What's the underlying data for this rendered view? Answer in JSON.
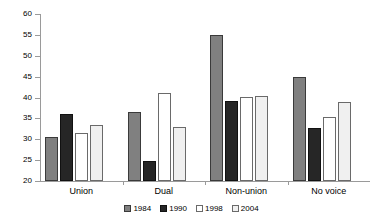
{
  "chart_data": {
    "type": "bar",
    "title": "",
    "subtitle": "",
    "xlabel": "",
    "ylabel": "",
    "categories": [
      "Union",
      "Dual",
      "Non-union",
      "No voice"
    ],
    "series": [
      {
        "name": "1984",
        "color": "#808080",
        "values": [
          30.6,
          36.6,
          54.9,
          44.8
        ]
      },
      {
        "name": "1990",
        "color": "#262626",
        "values": [
          36.0,
          24.8,
          39.2,
          32.8
        ]
      },
      {
        "name": "1998",
        "color": "#ffffff",
        "values": [
          31.4,
          41.0,
          40.1,
          35.3
        ]
      },
      {
        "name": "2004",
        "color": "#f0f0f0",
        "values": [
          33.4,
          33.0,
          40.3,
          38.9
        ]
      }
    ],
    "ylim": [
      20,
      60
    ],
    "yticks": [
      20,
      25,
      30,
      35,
      40,
      45,
      50,
      55,
      60
    ],
    "ytick_labels": [
      "20",
      "25",
      "30",
      "35",
      "40",
      "45",
      "50",
      "55",
      "60"
    ],
    "grid": false,
    "legend_position": "bottom"
  },
  "legend": {
    "items": [
      {
        "label": "1984",
        "color": "#808080"
      },
      {
        "label": "1990",
        "color": "#262626"
      },
      {
        "label": "1998",
        "color": "#ffffff"
      },
      {
        "label": "2004",
        "color": "#f0f0f0"
      }
    ]
  }
}
